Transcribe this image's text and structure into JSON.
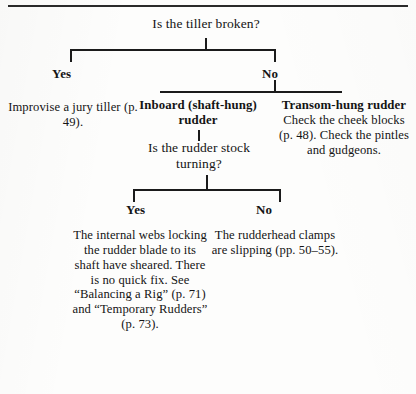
{
  "page": {
    "kind": "decision-flowchart"
  },
  "root": {
    "question": "Is the tiller broken?"
  },
  "level1": {
    "yes_label": "Yes",
    "no_label": "No",
    "yes_outcome": "Improvise a jury tiller (p. 49).",
    "no_children": [
      {
        "title": "Inboard (shaft-hung) rudder",
        "body": ""
      },
      {
        "title": "Transom-hung rudder",
        "body": "Check the cheek blocks (p. 48). Check the pintles and gudgeons."
      }
    ]
  },
  "level2": {
    "question": "Is the rudder stock turning?",
    "yes_label": "Yes",
    "no_label": "No",
    "yes_outcome": "The internal webs locking the rudder blade to its shaft have sheared. There is no quick fix. See “Balancing a Rig” (p. 71) and “Temporary Rudders” (p. 73).",
    "no_outcome": "The rudderhead clamps are slipping (pp. 50–55)."
  },
  "colors": {
    "ink": "#141414",
    "rule": "#1b1b1b",
    "paper": "#fdfdfc"
  }
}
